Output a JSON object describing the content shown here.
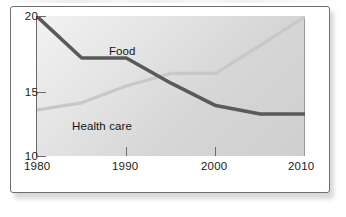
{
  "chart_data": {
    "type": "line",
    "title": "",
    "xlabel": "",
    "ylabel": "",
    "xlim": [
      1980,
      2010
    ],
    "ylim": [
      10,
      20
    ],
    "xticks": [
      "1980",
      "1990",
      "2000",
      "2010"
    ],
    "xtick_values": [
      1980,
      1990,
      2000,
      2010
    ],
    "yticks": [
      "10",
      "15",
      "20"
    ],
    "ytick_values": [
      10,
      15,
      20
    ],
    "grid": false,
    "legend": "inline-labels",
    "series": [
      {
        "name": "Food",
        "color": "#5a5a5a",
        "x": [
          1980,
          1985,
          1990,
          1995,
          2000,
          2005,
          2010
        ],
        "values": [
          20.0,
          17.0,
          17.0,
          15.2,
          13.6,
          13.0,
          13.0
        ]
      },
      {
        "name": "Health care",
        "color": "#c8c8c8",
        "x": [
          1980,
          1985,
          1990,
          1995,
          2000,
          2005,
          2010
        ],
        "values": [
          13.3,
          13.8,
          15.0,
          15.9,
          15.9,
          17.9,
          20.0
        ]
      }
    ]
  },
  "axis": {
    "y_labels": [
      "20",
      "15",
      "10"
    ],
    "x_labels": [
      "1980",
      "1990",
      "2000",
      "2010"
    ]
  },
  "labels": {
    "food": "Food",
    "health_care": "Health care"
  }
}
